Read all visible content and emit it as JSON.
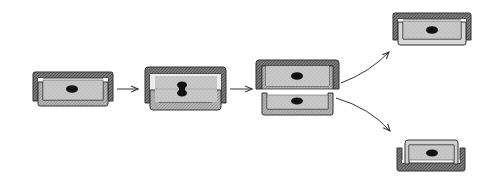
{
  "diagram": {
    "title": "",
    "colors": {
      "background": "#ffffff",
      "wall_dark": "#6e6e6e",
      "wall_light": "#a8a8a8",
      "cytoplasm": "#c4c4c4",
      "nucleus": "#111111",
      "arrow": "#333333"
    },
    "stages": [
      {
        "id": "parent-cell",
        "label": ""
      },
      {
        "id": "dividing-cell",
        "label": ""
      },
      {
        "id": "separating-cells",
        "label": ""
      },
      {
        "id": "daughter-cell-large",
        "label": ""
      },
      {
        "id": "daughter-cell-small",
        "label": ""
      }
    ],
    "arrows": [
      {
        "from": "parent-cell",
        "to": "dividing-cell"
      },
      {
        "from": "dividing-cell",
        "to": "separating-cells"
      },
      {
        "from": "separating-cells",
        "to": "daughter-cell-large"
      },
      {
        "from": "separating-cells",
        "to": "daughter-cell-small"
      }
    ]
  }
}
